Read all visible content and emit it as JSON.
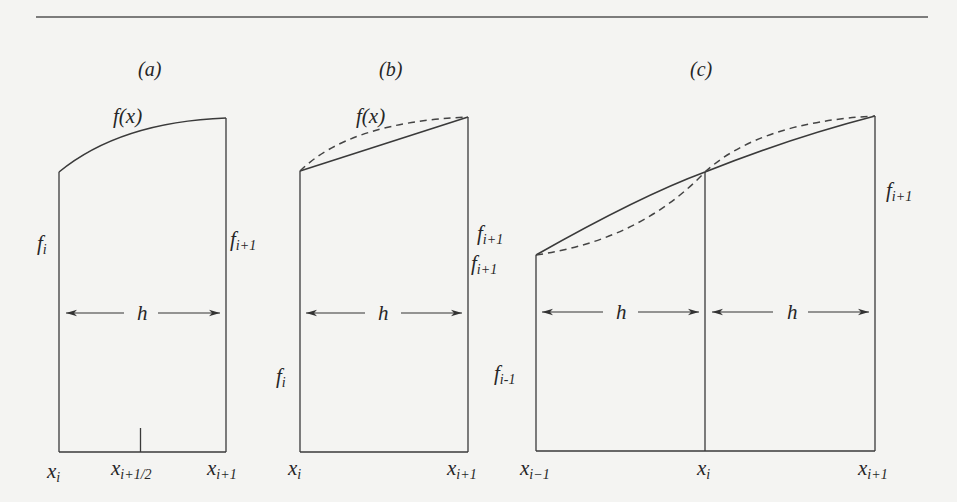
{
  "figure": {
    "rule": {
      "x1": 36,
      "x2": 928,
      "y": 17,
      "color": "#555555"
    },
    "panels": [
      {
        "id": "a",
        "label": "(a)",
        "label_pos": [
          168,
          70
        ],
        "curve_label": "f(x)",
        "curve_label_pos": [
          115,
          122
        ],
        "method": "midpoint rule",
        "left_value_label": {
          "main": "f",
          "sub": "i",
          "pos": [
            20,
            270
          ]
        },
        "right_value_label": {
          "main": "f",
          "sub": "i+1",
          "pos": [
            229,
            270
          ]
        },
        "width_label": "h",
        "x_labels": [
          {
            "main": "x",
            "sub": "i",
            "pos": [
              47,
              479
            ]
          },
          {
            "main": "x",
            "sub": "i+1/2",
            "pos": [
              112,
              479
            ]
          },
          {
            "main": "x",
            "sub": "i+1",
            "pos": [
              207,
              479
            ]
          }
        ]
      },
      {
        "id": "b",
        "label": "(b)",
        "label_pos": [
          383,
          70
        ],
        "curve_label": "f(x)",
        "curve_label_pos": [
          356,
          122
        ],
        "method": "trapezoidal rule",
        "left_value_label": {
          "main": "f",
          "sub": "i",
          "pos": [
            276,
            384
          ]
        },
        "right_value_label": {
          "main": "f",
          "sub": "i+1",
          "pos": [
            471,
            270
          ]
        },
        "width_label": "h",
        "x_labels": [
          {
            "main": "x",
            "sub": "i",
            "pos": [
              287,
              479
            ]
          },
          {
            "main": "x",
            "sub": "i+1",
            "pos": [
              447,
              479
            ]
          }
        ]
      },
      {
        "id": "c",
        "label": "(c)",
        "label_pos": [
          694,
          70
        ],
        "method": "Simpson's rule",
        "left_value_label": {
          "main": "f",
          "sub": "i-1",
          "pos": [
            493,
            380
          ]
        },
        "far_left_value_label": {
          "main": "f",
          "sub": "i+1",
          "pos": [
            477,
            244
          ]
        },
        "right_value_label": {
          "main": "f",
          "sub": "i+1",
          "pos": [
            886,
            197
          ]
        },
        "width_labels": [
          "h",
          "h"
        ],
        "x_labels": [
          {
            "main": "x",
            "sub": "i−1",
            "pos": [
              520,
              479
            ]
          },
          {
            "main": "x",
            "sub": "i",
            "pos": [
              697,
              479
            ]
          },
          {
            "main": "x",
            "sub": "i+1",
            "pos": [
              858,
              479
            ]
          }
        ]
      }
    ]
  }
}
